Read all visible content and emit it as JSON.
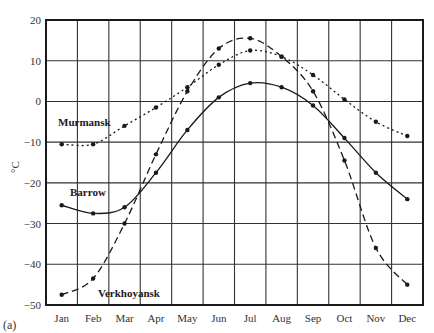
{
  "figure": {
    "panel_label": "(a)",
    "ylabel": "°C"
  },
  "chart_data": {
    "type": "line",
    "title": "",
    "xlabel": "",
    "ylabel": "°C",
    "categories": [
      "Jan",
      "Feb",
      "Mar",
      "Apr",
      "May",
      "Jun",
      "Jul",
      "Aug",
      "Sep",
      "Oct",
      "Nov",
      "Dec"
    ],
    "yticks": [
      20,
      10,
      0,
      -10,
      -20,
      -30,
      -40,
      -50
    ],
    "ylim": [
      -50,
      20
    ],
    "grid": true,
    "legend": "inline labels",
    "series": [
      {
        "name": "Murmansk",
        "style": "dotted",
        "values": [
          -10.5,
          -10.5,
          -6,
          -1.5,
          3.5,
          9,
          12.5,
          11,
          6.5,
          0.5,
          -5,
          -8.5
        ],
        "label_pos": [
          58,
          126
        ]
      },
      {
        "name": "Barrow",
        "style": "solid",
        "values": [
          -25.5,
          -27.5,
          -26,
          -17.5,
          -7,
          1,
          4.5,
          3.5,
          -1,
          -9,
          -17.5,
          -24
        ],
        "label_pos": [
          70,
          196
        ]
      },
      {
        "name": "Verkhoyansk",
        "style": "dashed",
        "values": [
          -47.5,
          -43.5,
          -30,
          -13,
          2.5,
          13,
          15.5,
          11,
          2.5,
          -14.5,
          -36,
          -45
        ],
        "label_pos": [
          98,
          297
        ]
      }
    ]
  }
}
